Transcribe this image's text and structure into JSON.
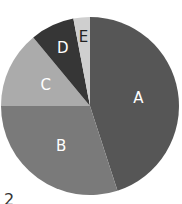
{
  "chart_data": {
    "type": "pie",
    "title": "",
    "categories": [
      "A",
      "B",
      "C",
      "D",
      "E"
    ],
    "values": [
      45,
      30,
      14,
      8,
      3
    ],
    "start_angle_deg_from_top_clockwise": 0,
    "colors": [
      "#565656",
      "#7a7a7a",
      "#ababab",
      "#363636",
      "#cfcfcf"
    ],
    "label_colors": [
      "#ffffff",
      "#ffffff",
      "#ffffff",
      "#ffffff",
      "#222222"
    ],
    "legend": "none",
    "data_labels": [
      "A",
      "B",
      "C",
      "D",
      "E"
    ]
  },
  "corner_text": "2"
}
